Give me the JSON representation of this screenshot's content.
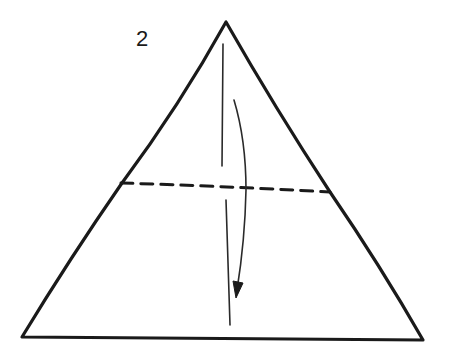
{
  "diagram": {
    "step_number": "2",
    "type": "origami fold instruction",
    "stroke_color": "#1a1a1a",
    "background": "#ffffff",
    "elements": {
      "paper": "triangle",
      "fold_line": "valley fold (dashed) across triangle",
      "arrow": "fold direction arrow pointing down",
      "crease": "vertical center crease line"
    }
  }
}
